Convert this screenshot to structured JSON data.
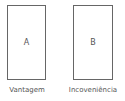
{
  "cards": [
    {
      "letter": "A",
      "caption": "Vantagem"
    },
    {
      "letter": "B",
      "caption": "Incoveniência"
    }
  ],
  "colors": {
    "border": "#666666",
    "text": "#555555",
    "background": "#ffffff"
  }
}
